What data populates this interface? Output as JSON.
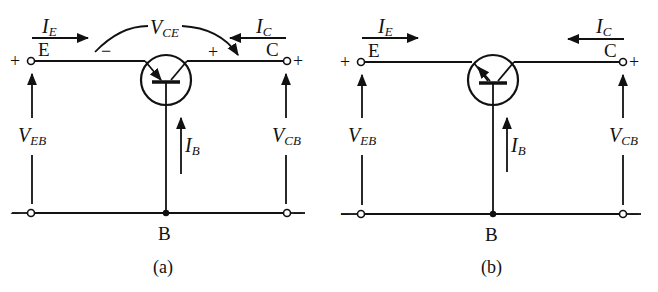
{
  "diagrams": [
    {
      "caption": "(a)",
      "type": "PNP common-base",
      "terminals": {
        "emitter": "E",
        "collector": "C",
        "base": "B"
      },
      "currents": {
        "emitter": {
          "main": "I",
          "sub": "E"
        },
        "collector": {
          "main": "I",
          "sub": "C"
        },
        "base": {
          "main": "I",
          "sub": "B"
        }
      },
      "voltages": {
        "eb": {
          "main": "V",
          "sub": "EB"
        },
        "cb": {
          "main": "V",
          "sub": "CB"
        },
        "ce": {
          "main": "V",
          "sub": "CE"
        }
      },
      "polarity": {
        "left_top": "+",
        "left_bottom": "−",
        "right_top": "+",
        "right_bottom": "−",
        "vce_minus": "−",
        "vce_plus": "+"
      }
    },
    {
      "caption": "(b)",
      "type": "PNP common-base (alt)",
      "terminals": {
        "emitter": "E",
        "collector": "C",
        "base": "B"
      },
      "currents": {
        "emitter": {
          "main": "I",
          "sub": "E"
        },
        "collector": {
          "main": "I",
          "sub": "C"
        },
        "base": {
          "main": "I",
          "sub": "B"
        }
      },
      "voltages": {
        "eb": {
          "main": "V",
          "sub": "EB"
        },
        "cb": {
          "main": "V",
          "sub": "CB"
        }
      },
      "polarity": {
        "left_top": "+",
        "left_bottom": "−",
        "right_top": "+",
        "right_bottom": "−"
      }
    }
  ]
}
